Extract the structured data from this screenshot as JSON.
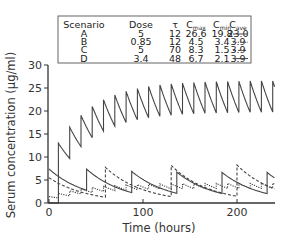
{
  "chart_data": {
    "type": "line",
    "title": "",
    "xlabel": "Time (hours)",
    "ylabel": "Serum concentration (µg/ml)",
    "xlim": [
      0,
      240
    ],
    "ylim": [
      0,
      30
    ],
    "xticks": [
      0,
      100,
      200
    ],
    "yticks": [
      0,
      5,
      10,
      15,
      20,
      25,
      30
    ],
    "grid": false,
    "legend_position": "top-inside-table",
    "legend_table": {
      "headers": [
        "Scenario",
        "Dose",
        "τ",
        "C_max",
        "C_min",
        "C_ave"
      ],
      "header_display": [
        {
          "main": "Scenario",
          "sub": ""
        },
        {
          "main": "Dose",
          "sub": ""
        },
        {
          "main": "τ",
          "sub": ""
        },
        {
          "main": "C",
          "sub": "max"
        },
        {
          "main": "C",
          "sub": "min"
        },
        {
          "main": "C",
          "sub": "ave"
        }
      ],
      "rows": [
        {
          "scenario": "A",
          "dose": "5",
          "tau": "12",
          "cmax": "26.6",
          "cmin": "19.8",
          "cave": "23.0",
          "style": "solid"
        },
        {
          "scenario": "B",
          "dose": "0.85",
          "tau": "12",
          "cmax": "4.5",
          "cmin": "3.4",
          "cave": "3.9",
          "style": "dotted"
        },
        {
          "scenario": "C",
          "dose": "5",
          "tau": "70",
          "cmax": "8.3",
          "cmin": "1.5",
          "cave": "3.9",
          "style": "dashed"
        },
        {
          "scenario": "D",
          "dose": "3.4",
          "tau": "48",
          "cmax": "6.7",
          "cmin": "2.1",
          "cave": "3.9",
          "style": "solid"
        }
      ]
    },
    "series": [
      {
        "name": "A",
        "style": "solid",
        "tau": 12,
        "start": 10,
        "first_jump": 13.0,
        "jump": 6.8,
        "k": 0.0246,
        "initial": 0
      },
      {
        "name": "B",
        "style": "dotted",
        "tau": 12,
        "start": 10,
        "first_jump": 1.0,
        "jump": 1.1,
        "k": 0.0246,
        "initial": 1.4
      },
      {
        "name": "C",
        "style": "dashed",
        "tau": 70,
        "start": 60,
        "first_jump": 6.5,
        "jump": 6.8,
        "k": 0.0246,
        "initial": 5.5
      },
      {
        "name": "D",
        "style": "solid",
        "tau": 48,
        "start": 40,
        "first_jump": 4.6,
        "jump": 4.6,
        "k": 0.0246,
        "initial": 7.4
      }
    ],
    "colors": {
      "line": "#444444",
      "axis": "#333333",
      "legend_border": "#555555"
    }
  }
}
